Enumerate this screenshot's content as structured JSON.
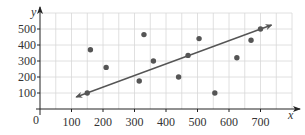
{
  "chart_data": {
    "type": "scatter",
    "title": "",
    "xlabel": "x",
    "ylabel": "y",
    "origin_label": "0",
    "xlim": [
      0,
      800
    ],
    "ylim": [
      0,
      600
    ],
    "grid": true,
    "x_ticks": [
      100,
      200,
      300,
      400,
      500,
      600,
      700
    ],
    "x_tick_labels": [
      "100",
      "200",
      "300",
      "400",
      "500",
      "600",
      "700"
    ],
    "y_ticks": [
      100,
      200,
      300,
      400,
      500
    ],
    "y_tick_labels": [
      "100",
      "200",
      "300",
      "400",
      "500"
    ],
    "series": [
      {
        "name": "data points",
        "points": [
          {
            "x": 150,
            "y": 100
          },
          {
            "x": 160,
            "y": 370
          },
          {
            "x": 210,
            "y": 260
          },
          {
            "x": 315,
            "y": 175
          },
          {
            "x": 330,
            "y": 465
          },
          {
            "x": 360,
            "y": 300
          },
          {
            "x": 440,
            "y": 200
          },
          {
            "x": 470,
            "y": 335
          },
          {
            "x": 505,
            "y": 440
          },
          {
            "x": 555,
            "y": 100
          },
          {
            "x": 625,
            "y": 320
          },
          {
            "x": 670,
            "y": 430
          },
          {
            "x": 700,
            "y": 500
          }
        ]
      }
    ],
    "trend_line": {
      "type": "line of best fit (double-arrowed)",
      "start": {
        "x": 115,
        "y": 75
      },
      "end": {
        "x": 735,
        "y": 525
      }
    },
    "legend": null
  },
  "colors": {
    "point": "#555555",
    "line": "#555555",
    "grid": "#d8d8d8",
    "axis": "#222222"
  }
}
